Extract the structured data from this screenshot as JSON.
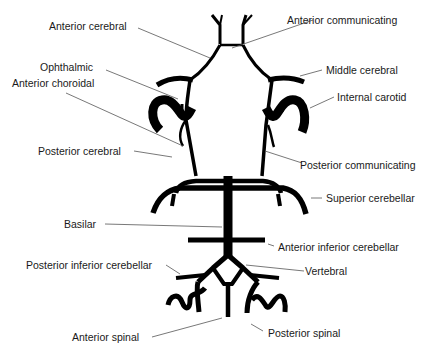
{
  "diagram": {
    "labels": {
      "anterior_cerebral": "Anterior cerebral",
      "anterior_communicating": "Anterior communicating",
      "ophthalmic": "Ophthalmic",
      "anterior_choroidal": "Anterior choroidal",
      "middle_cerebral": "Middle cerebral",
      "internal_carotid": "Internal carotid",
      "posterior_cerebral": "Posterior cerebral",
      "posterior_communicating": "Posterior communicating",
      "superior_cerebellar": "Superior cerebellar",
      "basilar": "Basilar",
      "anterior_inferior_cerebellar": "Anterior inferior cerebellar",
      "posterior_inferior_cerebellar": "Posterior inferior cerebellar",
      "vertebral": "Vertebral",
      "anterior_spinal": "Anterior spinal",
      "posterior_spinal": "Posterior spinal"
    },
    "colors": {
      "vessel": "#000000",
      "leader": "#555555",
      "text": "#1a1a1a",
      "background": "#ffffff"
    }
  }
}
